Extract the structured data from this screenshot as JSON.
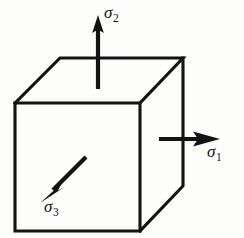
{
  "figure": {
    "background_color": "#fdfdfc",
    "line_color": "#131313",
    "width": 244,
    "height": 238
  },
  "cube": {
    "name": "stress-element-cube",
    "projection": "oblique",
    "front_face": {
      "label": "front-face",
      "top_left": [
        15,
        103
      ],
      "top_right": [
        140,
        103
      ],
      "bottom_right": [
        140,
        231
      ],
      "bottom_left": [
        15,
        231
      ]
    },
    "top_face": {
      "label": "top-face",
      "front_left": [
        15,
        103
      ],
      "front_right": [
        140,
        103
      ],
      "back_right": [
        183,
        58
      ],
      "back_left": [
        60,
        58
      ]
    },
    "right_face": {
      "label": "right-face",
      "front_top": [
        140,
        103
      ],
      "back_top": [
        183,
        58
      ],
      "back_bottom": [
        183,
        186
      ],
      "front_bottom": [
        140,
        231
      ]
    },
    "depth_offset": [
      43,
      -45
    ]
  },
  "arrows": [
    {
      "id": "sigma1",
      "name": "sigma-1-arrow",
      "label": "σ",
      "subscript": "1",
      "direction": "right",
      "axis": "x",
      "from": [
        160,
        139
      ],
      "to": [
        219,
        139
      ],
      "pierces": "right-face",
      "description": "Tensile principal stress normal to the right face"
    },
    {
      "id": "sigma2",
      "name": "sigma-2-arrow",
      "label": "σ",
      "subscript": "2",
      "direction": "up",
      "axis": "y",
      "from": [
        98,
        89
      ],
      "to": [
        98,
        16
      ],
      "pierces": "top-face",
      "description": "Tensile principal stress normal to the top face"
    },
    {
      "id": "sigma3",
      "name": "sigma-3-arrow",
      "label": "σ",
      "subscript": "3",
      "direction": "down-left",
      "axis": "z",
      "from": [
        86,
        157
      ],
      "to": [
        41,
        202
      ],
      "pierces": "front-face",
      "description": "Compressive principal stress normal to the front face"
    }
  ],
  "labels": {
    "sigma1": {
      "symbol": "σ",
      "subscript": "1"
    },
    "sigma2": {
      "symbol": "σ",
      "subscript": "2"
    },
    "sigma3": {
      "symbol": "σ",
      "subscript": "3"
    }
  }
}
